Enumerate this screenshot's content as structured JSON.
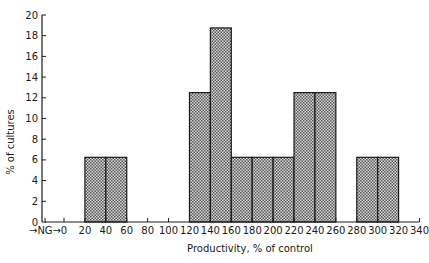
{
  "chart_data": {
    "type": "bar",
    "title": "",
    "xlabel": "Productivity, % of control",
    "ylabel": "% of cultures",
    "ylim": [
      0,
      20
    ],
    "xlim": [
      0,
      340
    ],
    "grid": false,
    "legend": null,
    "x_tick_labels": [
      "NG",
      "0",
      "20",
      "40",
      "60",
      "80",
      "100",
      "120",
      "140",
      "160",
      "180",
      "200",
      "220",
      "240",
      "260",
      "280",
      "300",
      "320",
      "340"
    ],
    "x_ticks": [
      0,
      20,
      40,
      60,
      80,
      100,
      120,
      140,
      160,
      180,
      200,
      220,
      240,
      260,
      280,
      300,
      320,
      340
    ],
    "y_ticks": [
      0,
      2,
      4,
      6,
      8,
      10,
      12,
      14,
      16,
      18,
      20
    ],
    "bins": [
      {
        "from": 20,
        "to": 40,
        "value": 6.25
      },
      {
        "from": 40,
        "to": 60,
        "value": 6.25
      },
      {
        "from": 120,
        "to": 140,
        "value": 12.5
      },
      {
        "from": 140,
        "to": 160,
        "value": 18.75
      },
      {
        "from": 160,
        "to": 180,
        "value": 6.25
      },
      {
        "from": 180,
        "to": 200,
        "value": 6.25
      },
      {
        "from": 200,
        "to": 220,
        "value": 6.25
      },
      {
        "from": 220,
        "to": 240,
        "value": 12.5
      },
      {
        "from": 240,
        "to": 260,
        "value": 12.5
      },
      {
        "from": 280,
        "to": 300,
        "value": 6.25
      },
      {
        "from": 300,
        "to": 320,
        "value": 6.25
      }
    ],
    "bar_fill": "#a8a8a8",
    "bar_stroke": "#1a1a1a"
  }
}
